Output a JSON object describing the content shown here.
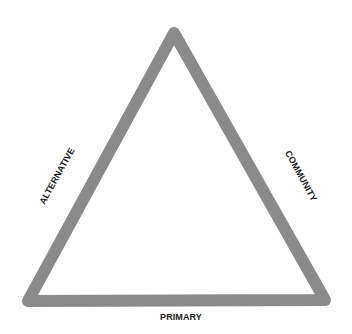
{
  "diagram": {
    "type": "triangle",
    "stroke_color": "#8a8a8a",
    "stroke_width": 12,
    "background": "#ffffff",
    "vertices": {
      "top": [
        174,
        33
      ],
      "bottom_left": [
        28,
        301
      ],
      "bottom_right": [
        325,
        300
      ]
    },
    "labels": {
      "bottom": "PRIMARY",
      "left": "ALTERNATIVE",
      "right": "COMMUNITY"
    },
    "label_color": "#1c1c1c"
  }
}
